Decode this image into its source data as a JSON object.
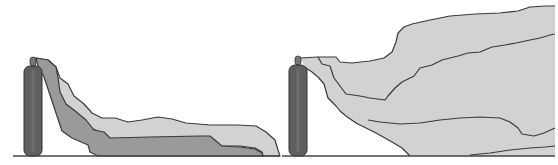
{
  "diagram": {
    "colors": {
      "background": "#ffffff",
      "cylinder": "#5f5f5f",
      "cylinder_outline": "#333333",
      "ground_line": "#444444",
      "plume_light": "#d2d2d2",
      "plume_dark": "#9a9a9a",
      "plume_outline": "#3a3a3a"
    },
    "panels": [
      {
        "id": "left",
        "object": "gas-cylinder",
        "plume": "dense-gas-ground-hugging"
      },
      {
        "id": "right",
        "object": "gas-cylinder",
        "plume": "buoyant-gas-rising"
      }
    ]
  }
}
